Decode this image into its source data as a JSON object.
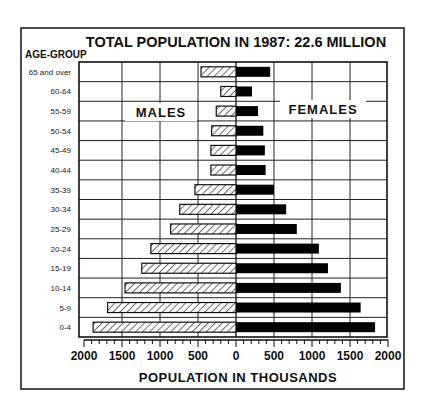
{
  "chart_data": {
    "type": "bar",
    "subtype": "population-pyramid",
    "title": "TOTAL POPULATION IN 1987: 22.6 MILLION",
    "ylabel": "AGE-GROUP",
    "xlabel": "POPULATION IN THOUSANDS",
    "categories": [
      "65 and over",
      "60-64",
      "55-59",
      "50-54",
      "45-49",
      "40-44",
      "35-39",
      "30-34",
      "25-29",
      "20-24",
      "15-19",
      "10-14",
      "5-9",
      "0-4"
    ],
    "series": [
      {
        "name": "MALES",
        "side": "left",
        "fill": "hatched",
        "values": [
          460,
          200,
          260,
          320,
          330,
          330,
          540,
          740,
          860,
          1120,
          1240,
          1460,
          1690,
          1880
        ]
      },
      {
        "name": "FEMALES",
        "side": "right",
        "fill": "#000000",
        "values": [
          450,
          210,
          290,
          360,
          380,
          390,
          500,
          660,
          800,
          1090,
          1210,
          1380,
          1640,
          1830
        ]
      }
    ],
    "xticks_left": [
      "2000",
      "1500",
      "1000",
      "500",
      "0"
    ],
    "xticks_right": [
      "500",
      "1000",
      "1500",
      "2000"
    ],
    "xlim": [
      -2000,
      2000
    ],
    "major_tick_step": 500,
    "minor_tick_step": 100,
    "grid": true,
    "annotations": [
      "MALES",
      "FEMALES"
    ],
    "legend": "none"
  },
  "labels": {
    "title": "TOTAL POPULATION IN 1987: 22.6 MILLION",
    "age_group": "AGE-GROUP",
    "males": "MALES",
    "females": "FEMALES",
    "x_axis": "POPULATION IN THOUSANDS"
  },
  "colors": {
    "ink": "#111111",
    "female_bar": "#000000",
    "male_bar_bg": "#ffffff",
    "grid": "#222222",
    "background": "#ffffff"
  }
}
